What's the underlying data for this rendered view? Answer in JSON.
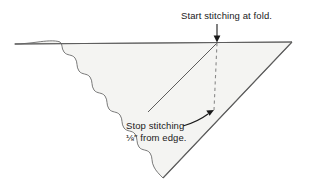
{
  "figure": {
    "type": "sewing-instruction-diagram",
    "background_color": "#ffffff",
    "fabric_fill_color": "#f4f4f2",
    "line_color": "#6b6b6b",
    "text_color": "#1a1a1a"
  },
  "annotations": {
    "start": {
      "text": "Start stitching at fold.",
      "arrow": "down-arrow-icon"
    },
    "stop": {
      "line1": "Stop stitching",
      "fraction": "⅛",
      "unit": "″",
      "line2_rest": " from edge.",
      "arrow": "curved-arrow-icon"
    }
  },
  "shapes": {
    "fabric_triangle": "triangle-with-scalloped-left-edge",
    "fold_line": "dashed-vertical-line",
    "stitch_line": "solid-diagonal-line",
    "top_edge": "straight-top-edge",
    "right_edge": "straight-right-edge"
  },
  "points": {
    "fold_point": {
      "x": 217,
      "y": 42
    },
    "stop_point": {
      "x": 214,
      "y": 112
    },
    "right_vertex": {
      "x": 292,
      "y": 42
    },
    "bottom_vertex": {
      "x": 163,
      "y": 178
    },
    "top_left": {
      "x": 15,
      "y": 44
    }
  }
}
